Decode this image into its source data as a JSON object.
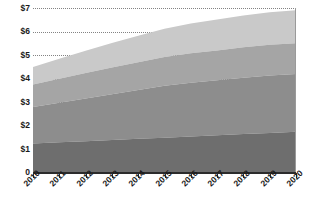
{
  "chart_data": {
    "type": "area",
    "title": "",
    "subtitle": "",
    "xlabel": "",
    "ylabel": "",
    "stacked": true,
    "grid": true,
    "legend_position": "none",
    "x": [
      "2010",
      "2011",
      "2012",
      "2013",
      "2014",
      "2015",
      "2016",
      "2017",
      "2018",
      "2019",
      "2020"
    ],
    "categories": [
      "2010",
      "2011",
      "2012",
      "2013",
      "2014",
      "2015",
      "2016",
      "2017",
      "2018",
      "2019",
      "2020"
    ],
    "ylim": [
      0,
      7
    ],
    "yticks": [
      0,
      1,
      2,
      3,
      4,
      5,
      6,
      7
    ],
    "ytick_labels": [
      "0",
      "$1",
      "$2",
      "$3",
      "$4",
      "$5",
      "$6",
      "$7"
    ],
    "xtick_labels": [
      "2010",
      "2011",
      "2012",
      "2013",
      "2014",
      "2015",
      "2016",
      "2017",
      "2018",
      "2019",
      "2020"
    ],
    "series": [
      {
        "name": "Series 1",
        "color": "#6e6e6e",
        "values": [
          1.25,
          1.3,
          1.35,
          1.4,
          1.45,
          1.5,
          1.55,
          1.6,
          1.65,
          1.7,
          1.75
        ]
      },
      {
        "name": "Series 2",
        "color": "#8d8d8d",
        "values": [
          1.55,
          1.68,
          1.81,
          1.94,
          2.07,
          2.2,
          2.28,
          2.33,
          2.39,
          2.44,
          2.45
        ]
      },
      {
        "name": "Series 3",
        "color": "#a5a5a5",
        "values": [
          0.95,
          1.02,
          1.08,
          1.14,
          1.18,
          1.22,
          1.25,
          1.27,
          1.29,
          1.3,
          1.3
        ]
      },
      {
        "name": "Series 4",
        "color": "#c9c9c9",
        "values": [
          0.75,
          0.85,
          0.95,
          1.04,
          1.12,
          1.2,
          1.26,
          1.31,
          1.35,
          1.38,
          1.4
        ]
      }
    ],
    "cumulative_totals": [
      4.5,
      4.85,
      5.19,
      5.52,
      5.82,
      6.12,
      6.34,
      6.51,
      6.68,
      6.82,
      6.9
    ],
    "axis_color": "#2b2b2b",
    "gridline_color": "#6e6e6e",
    "background_color": "#ffffff"
  }
}
